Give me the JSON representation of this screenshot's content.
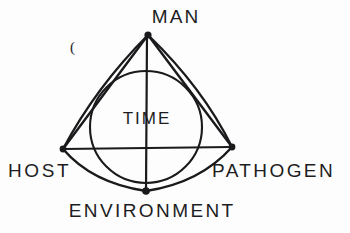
{
  "figure": {
    "background_color": "#fdfdfd",
    "ink_color": "#1a1a1c",
    "stray_mark": "(",
    "vertices": [
      {
        "id": "man",
        "label": "MAN",
        "x": 148,
        "y": 35,
        "role": "apex-top"
      },
      {
        "id": "host",
        "label": "HOST",
        "x": 63,
        "y": 149,
        "role": "vertex-left"
      },
      {
        "id": "pathogen",
        "label": "PATHOGEN",
        "x": 232,
        "y": 147,
        "role": "vertex-right"
      },
      {
        "id": "environment",
        "label": "ENVIRONMENT",
        "x": 146,
        "y": 191,
        "role": "vertex-bottom"
      }
    ],
    "center_label": "TIME",
    "circle": {
      "cx": 146,
      "cy": 127,
      "r": 56,
      "stroke_width": 2.1
    },
    "edges": [
      {
        "id": "man-host",
        "from": "man",
        "to": "host",
        "kind": "straight"
      },
      {
        "id": "man-pathogen",
        "from": "man",
        "to": "pathogen",
        "kind": "straight"
      },
      {
        "id": "host-pathogen",
        "from": "host",
        "to": "pathogen",
        "kind": "straight-horizontal"
      },
      {
        "id": "man-environment",
        "from": "man",
        "to": "environment",
        "kind": "straight-vertical"
      },
      {
        "id": "host-environment",
        "from": "host",
        "to": "environment",
        "kind": "curved-arc"
      },
      {
        "id": "environment-pathogen",
        "from": "environment",
        "to": "pathogen",
        "kind": "curved-arc"
      },
      {
        "id": "man-pathogen-arc",
        "from": "man",
        "to": "pathogen",
        "kind": "curved-arc"
      },
      {
        "id": "host-man-arc",
        "from": "host",
        "to": "man",
        "kind": "curved-arc"
      }
    ]
  }
}
